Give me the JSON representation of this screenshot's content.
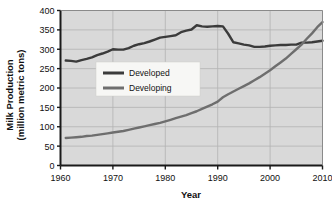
{
  "chart_data": {
    "type": "line",
    "title": "",
    "xlabel": "Year",
    "ylabel": "Milk Production (million metric tons)",
    "ylabel_line1": "Milk Production",
    "ylabel_line2": "(million metric tons)",
    "xlim": [
      1960,
      2010
    ],
    "ylim": [
      0,
      400
    ],
    "xticks": [
      1960,
      1970,
      1980,
      1990,
      2000,
      2010
    ],
    "xtick_labels": [
      "1960",
      "1970",
      "1980",
      "1990",
      "2000",
      "2010"
    ],
    "yticks": [
      0,
      50,
      100,
      150,
      200,
      250,
      300,
      350,
      400
    ],
    "ytick_labels": [
      "0",
      "50",
      "100",
      "150",
      "200",
      "250",
      "300",
      "350",
      "400"
    ],
    "grid": true,
    "legend_position": "center-left",
    "plot_background": "#d9d9d9",
    "gridline_color": "#b3b3b3",
    "series": [
      {
        "name": "Developed",
        "color": "#3b3b3b",
        "x": [
          1961,
          1962,
          1963,
          1964,
          1965,
          1966,
          1967,
          1968,
          1969,
          1970,
          1971,
          1972,
          1973,
          1974,
          1975,
          1976,
          1977,
          1978,
          1979,
          1980,
          1981,
          1982,
          1983,
          1984,
          1985,
          1986,
          1987,
          1988,
          1989,
          1990,
          1991,
          1992,
          1993,
          1994,
          1995,
          1996,
          1997,
          1998,
          1999,
          2000,
          2001,
          2002,
          2003,
          2004,
          2005,
          2006,
          2007,
          2008,
          2009,
          2010
        ],
        "values": [
          271,
          270,
          268,
          272,
          275,
          279,
          285,
          289,
          294,
          300,
          299,
          299,
          303,
          309,
          313,
          316,
          320,
          325,
          330,
          332,
          334,
          336,
          344,
          348,
          351,
          362,
          359,
          358,
          359,
          360,
          359,
          340,
          318,
          315,
          312,
          310,
          306,
          306,
          307,
          309,
          310,
          311,
          311,
          312,
          312,
          317,
          317,
          318,
          320,
          322
        ]
      },
      {
        "name": "Developing",
        "color": "#6e6e6e",
        "x": [
          1961,
          1962,
          1963,
          1964,
          1965,
          1966,
          1967,
          1968,
          1969,
          1970,
          1971,
          1972,
          1973,
          1974,
          1975,
          1976,
          1977,
          1978,
          1979,
          1980,
          1981,
          1982,
          1983,
          1984,
          1985,
          1986,
          1987,
          1988,
          1989,
          1990,
          1991,
          1992,
          1993,
          1994,
          1995,
          1996,
          1997,
          1998,
          1999,
          2000,
          2001,
          2002,
          2003,
          2004,
          2005,
          2006,
          2007,
          2008,
          2009,
          2010
        ],
        "values": [
          71,
          72,
          73,
          74,
          76,
          77,
          79,
          81,
          83,
          85,
          87,
          89,
          92,
          95,
          98,
          101,
          104,
          107,
          110,
          114,
          118,
          122,
          126,
          130,
          135,
          140,
          146,
          152,
          158,
          165,
          176,
          184,
          191,
          198,
          205,
          212,
          220,
          228,
          237,
          246,
          256,
          266,
          276,
          288,
          300,
          312,
          327,
          341,
          357,
          370
        ]
      }
    ],
    "annotations": []
  },
  "legend": {
    "items": [
      {
        "label": "Developed",
        "color": "#3b3b3b"
      },
      {
        "label": "Developing",
        "color": "#6e6e6e"
      }
    ]
  }
}
